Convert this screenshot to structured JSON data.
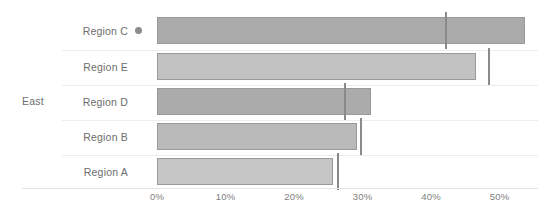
{
  "chart_data": {
    "type": "bar",
    "orientation": "horizontal",
    "title": "",
    "xlabel": "",
    "ylabel": "",
    "group_label": "East",
    "categories": [
      "Region C",
      "Region E",
      "Region D",
      "Region B",
      "Region A"
    ],
    "values": [
      53.7,
      46.6,
      31.2,
      29.2,
      25.7
    ],
    "series": [
      {
        "name": "Value",
        "values": [
          53.7,
          46.6,
          31.2,
          29.2,
          25.7
        ]
      },
      {
        "name": "Target",
        "values": [
          42.2,
          48.5,
          27.4,
          29.8,
          26.4
        ]
      }
    ],
    "target_markers": [
      42.2,
      48.5,
      27.4,
      29.8,
      26.4
    ],
    "xlim": [
      0,
      56
    ],
    "xticks": [
      0,
      10,
      20,
      30,
      40,
      50
    ],
    "xtick_labels": [
      "0%",
      "10%",
      "20%",
      "30%",
      "40%",
      "50%"
    ],
    "grid": false,
    "legend": "none",
    "bar_colors": [
      "#aaaaaa",
      "#c2c2c2",
      "#ababab",
      "#bababa",
      "#c6c6c6"
    ],
    "bar_border_color": "#9a9a9a",
    "marker_color": "#8a8a8a",
    "dot_color": "#8c8c8c",
    "axis_text_color": "#7e7e7e",
    "label_text_color": "#6d6d6d",
    "separator_color": "#ededed",
    "background": "#ffffff",
    "highlight_row": "Region C"
  },
  "rows": [
    {
      "label": "Region C",
      "value": 53.7,
      "target": 42.2,
      "has_dot": true
    },
    {
      "label": "Region E",
      "value": 46.6,
      "target": 48.5,
      "has_dot": false
    },
    {
      "label": "Region D",
      "value": 31.2,
      "target": 27.4,
      "has_dot": false
    },
    {
      "label": "Region B",
      "value": 29.2,
      "target": 29.8,
      "has_dot": false
    },
    {
      "label": "Region A",
      "value": 25.7,
      "target": 26.4,
      "has_dot": false
    }
  ],
  "axis": {
    "ticks": [
      {
        "label": "0%"
      },
      {
        "label": "10%"
      },
      {
        "label": "20%"
      },
      {
        "label": "30%"
      },
      {
        "label": "40%"
      },
      {
        "label": "50%"
      }
    ]
  },
  "group": {
    "label": "East"
  }
}
